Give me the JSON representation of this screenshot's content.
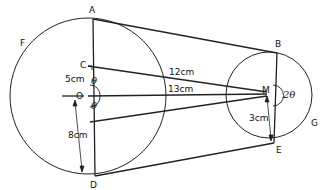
{
  "diagram": {
    "points": {
      "A": "A",
      "B": "B",
      "C": "C",
      "D": "D",
      "E": "E",
      "F": "F",
      "G": "G",
      "O": "O",
      "M": "M"
    },
    "lengths": {
      "OC": "5cm",
      "CM": "12cm",
      "OM": "13cm",
      "OD": "8cm",
      "ME": "3cm"
    },
    "angles": {
      "theta_upper": "θ",
      "theta_lower": "θ",
      "two_theta": "2θ"
    },
    "colors": {
      "stroke": "#222222",
      "background": "#ffffff"
    }
  }
}
